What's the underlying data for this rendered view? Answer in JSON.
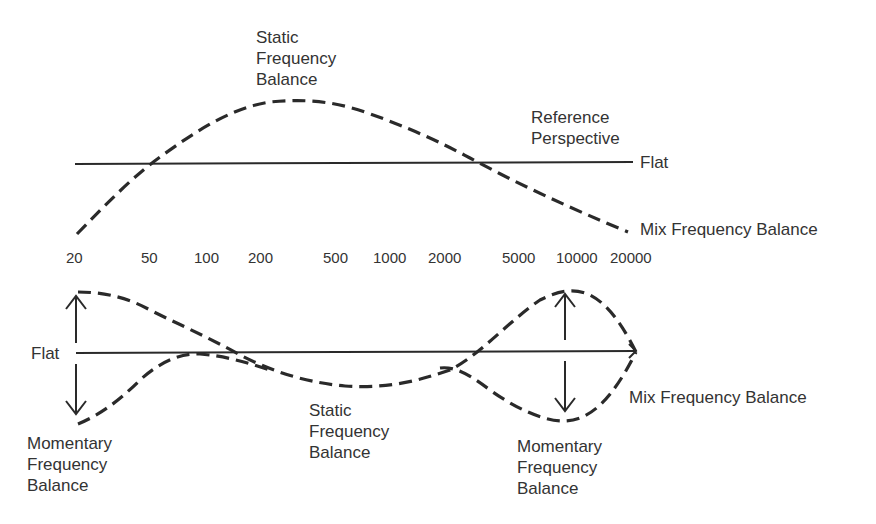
{
  "top_panel": {
    "static_label": [
      "Static",
      "Frequency",
      "Balance"
    ],
    "reference_label": [
      "Reference",
      "Perspective"
    ],
    "flat_label": "Flat",
    "mix_label": "Mix Frequency Balance"
  },
  "axis": {
    "ticks": [
      "20",
      "50",
      "100",
      "200",
      "500",
      "1000",
      "2000",
      "5000",
      "10000",
      "20000"
    ]
  },
  "bottom_panel": {
    "flat_label": "Flat",
    "momentary_left_label": [
      "Momentary",
      "Frequency",
      "Balance"
    ],
    "static_label": [
      "Static",
      "Frequency",
      "Balance"
    ],
    "momentary_right_label": [
      "Momentary",
      "Frequency",
      "Balance"
    ],
    "mix_label": "Mix Frequency Balance"
  },
  "colors": {
    "line": "#2a2a2a",
    "text": "#333333",
    "background": "#ffffff"
  }
}
